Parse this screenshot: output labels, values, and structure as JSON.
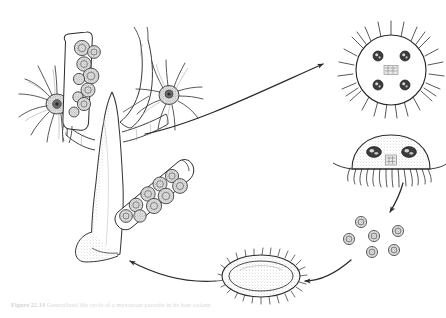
{
  "figure": {
    "caption_label": "Figure 22.14",
    "caption_text": "Generalized life cycle of a myxozoan parasite in its host colony.",
    "background_color": "#ffffff",
    "ink_color": "#2b2b2b",
    "fill_color": "#f4f4f4",
    "shade_color": "#8a8a8a",
    "caption_color": "#d8d8d8"
  },
  "stages": [
    {
      "id": "host-colony",
      "label": "Branching host colony with polyps and spore-filled sacs",
      "position": {
        "x": 20,
        "y": 18
      },
      "feature_counts": {
        "polyps": 2,
        "spore_sacs": 2,
        "spores_per_sac": 9
      }
    },
    {
      "id": "spiky-sporangium",
      "label": "Spiny spherical sporangium with four nuclei",
      "position": {
        "x": 352,
        "y": 22
      },
      "feature_counts": {
        "nuclei": 4,
        "spines": 26
      }
    },
    {
      "id": "ciliated-cell",
      "label": "Dome-shaped ciliated cell with two nuclei",
      "position": {
        "x": 352,
        "y": 134
      },
      "feature_counts": {
        "nuclei": 2,
        "cilia": 14
      }
    },
    {
      "id": "free-spores",
      "label": "Released free spores",
      "position": {
        "x": 344,
        "y": 210
      },
      "feature_counts": {
        "spores": 6
      }
    },
    {
      "id": "spiny-cyst",
      "label": "Oval spiny cyst stage",
      "position": {
        "x": 222,
        "y": 264
      },
      "feature_counts": {
        "spines": 34
      }
    }
  ],
  "arrows": [
    {
      "id": "arrow-colony-to-sporangium",
      "label": "colony to sporangium",
      "direction": "up-right"
    },
    {
      "id": "arrow-cell-to-spores",
      "label": "ciliated cell to free spores",
      "direction": "down"
    },
    {
      "id": "arrow-spores-to-cyst",
      "label": "free spores to cyst",
      "direction": "down-left"
    },
    {
      "id": "arrow-cyst-to-colony",
      "label": "cyst back to host colony",
      "direction": "up-left"
    }
  ]
}
